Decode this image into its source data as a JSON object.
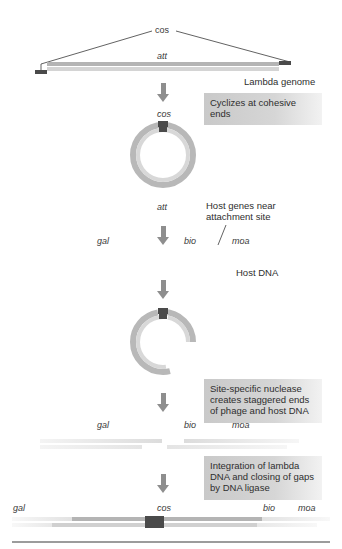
{
  "diagram": {
    "stage1": {
      "cos_label": "cos",
      "att_label": "att",
      "caption": "Lambda genome"
    },
    "step1_box": "Cyclizes at cohesive ends",
    "stage2": {
      "cos_label": "cos",
      "att_label": "att",
      "host_genes_caption": "Host genes near attachment site"
    },
    "stage3": {
      "genes": [
        "gal",
        "bio",
        "moa"
      ],
      "caption": "Host DNA"
    },
    "step2_box": "Site-specific nuclease creates staggered ends of phage and host DNA",
    "stage4": {
      "genes": [
        "gal",
        "bio",
        "moa"
      ]
    },
    "step3_box": "Integration of lambda DNA and closing of gaps by DNA ligase",
    "stage5": {
      "genes": [
        "gal",
        "cos",
        "bio",
        "moa"
      ]
    },
    "colors": {
      "dark_end": "#4a4a4a",
      "strand_top": "#b4b4b4",
      "strand_bottom": "#d0d0d0",
      "arrow": "#8e8e8e",
      "box_bg": "#cccccc"
    }
  }
}
